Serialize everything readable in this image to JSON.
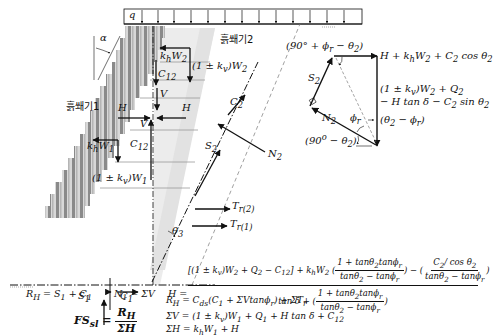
{
  "diagram": {
    "surcharge_label": "q",
    "angle_alpha": "α",
    "block1_label": "흙쐐기1",
    "block2_label": "흙쐐기2",
    "forces": {
      "khW2": "k_hW_2",
      "kvW2": "(1 ± k_v)W_2",
      "C12_top": "C_12",
      "V_top": "V",
      "H_right": "H",
      "H_left": "H",
      "V_lower": "V",
      "C12_lower": "C_12",
      "khW1": "k_hW_1",
      "kvW1": "(1 ± k_v)W_1",
      "C2": "C_2",
      "S2": "S_2",
      "N2": "N_2",
      "Tr2": "T_r(2)",
      "Tr1": "T_r(1)",
      "theta2": "θ_2",
      "S1": "S_1",
      "C1": "C_1"
    },
    "force_polygon": {
      "top_angle": "(90° + ϕ_r − θ_2)",
      "top_right": "H + k_hW_2 + C_2 cos θ_2",
      "right_line1": "(1 ± k_v)W_2 + Q_2",
      "right_line2": "− H tan δ − C_2 sin θ_2",
      "S2": "S_2",
      "N2": "N_2",
      "phi_r": "ϕ_r",
      "angle_diff": "(θ_2 − ϕ_r)",
      "bottom_angle": "(90° − θ_2)"
    }
  },
  "equations": {
    "RH_sum": "R_H = S_1 + C_1",
    "N1": "N_1 = ΣV",
    "H_lhs": "H =",
    "H_num_a": "[(1 ± k_v)W_2 + Q_2 − C_12] + k_hW_2",
    "H_num_frac1_num": "1 + tanθ_2tanϕ_r",
    "H_num_frac1_den": "tanθ_2 − tanϕ_r",
    "H_num_minus": "−",
    "H_num_frac2_num": "C_2/ cos θ_2",
    "H_num_frac2_den": "tanθ_2 − tanϕ_r",
    "H_den_a": "tan δ +",
    "H_den_frac_num": "1 + tanθ_2tanϕ_r",
    "H_den_frac_den": "tanθ_2 − tanϕ_r",
    "FS_lhs": "FS_sl =",
    "FS_num": "R_H",
    "FS_den": "ΣH",
    "RH_full": "R_H = C_ds(C_1 + ΣVtanϕ_r) + ΣT_r",
    "SumV": "ΣV = (1 ± k_v)W_1 + Q_1 + H tan δ + C_12",
    "SumH": "ΣH = k_hW_1 + H"
  },
  "colors": {
    "ink": "#111111",
    "wedge_fill": "#e6e6e6",
    "block_dark": "#8a8a8a",
    "block_light": "#d8d8d8",
    "guide": "#9a9a9a"
  }
}
